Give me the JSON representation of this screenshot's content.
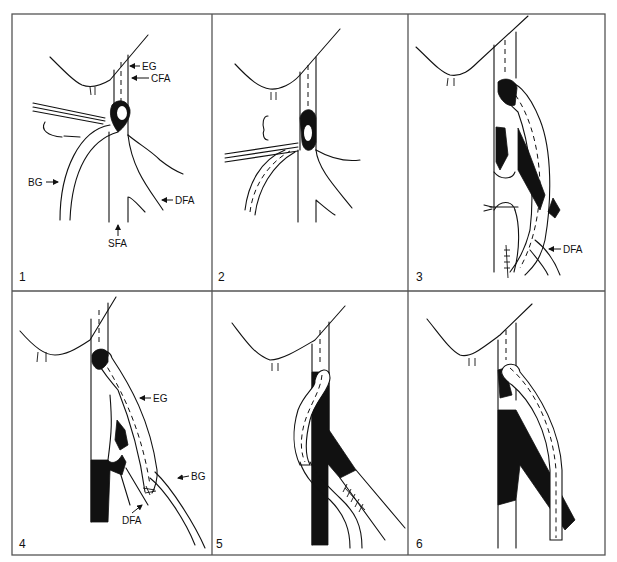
{
  "figure": {
    "layout": "2 rows x 3 columns",
    "panels": [
      {
        "number": "1",
        "labels": [
          "EG",
          "CFA",
          "BG",
          "DFA",
          "SFA"
        ]
      },
      {
        "number": "2",
        "labels": []
      },
      {
        "number": "3",
        "labels": [
          "DFA"
        ]
      },
      {
        "number": "4",
        "labels": [
          "EG",
          "BG",
          "DFA"
        ]
      },
      {
        "number": "5",
        "labels": []
      },
      {
        "number": "6",
        "labels": []
      }
    ]
  },
  "labels": {
    "p1": {
      "eg": "EG",
      "cfa": "CFA",
      "bg": "BG",
      "dfa": "DFA",
      "sfa": "SFA"
    },
    "p3": {
      "dfa": "DFA"
    },
    "p4": {
      "eg": "EG",
      "bg": "BG",
      "dfa": "DFA"
    }
  },
  "colors": {
    "ink": "#111111",
    "frame": "#555555",
    "background": "#ffffff"
  }
}
